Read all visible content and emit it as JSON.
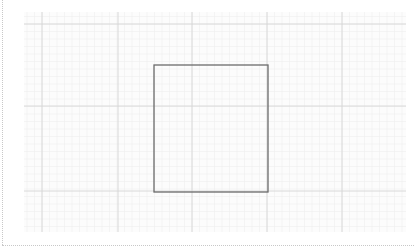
{
  "diagram": {
    "type": "grid-canvas",
    "grid": {
      "minor_color": "#efefef",
      "major_color": "#d6d6d6",
      "background": "#fcfcfc"
    },
    "shapes": [
      {
        "kind": "rectangle",
        "stroke": "#6b6b6b",
        "fill": "none"
      }
    ],
    "page_border_color": "#c8c8c8"
  }
}
